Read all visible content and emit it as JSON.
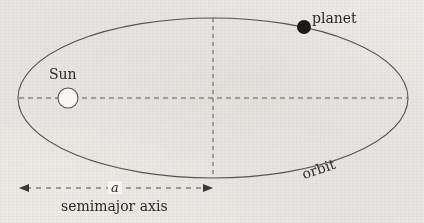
{
  "figure": {
    "width": 424,
    "height": 223,
    "background_color": "#f6f5f3",
    "ink_color": "#4a4845"
  },
  "labels": {
    "planet": "planet",
    "sun": "Sun",
    "orbit": "orbit",
    "semimajor_axis": "semimajor axis",
    "a_symbol": "a"
  },
  "geometry": {
    "ellipse": {
      "center_x": 213,
      "center_y": 98,
      "radius_x": 195,
      "radius_y": 80,
      "stroke": "#55534f",
      "stroke_width": 1.1
    },
    "sun": {
      "center_x": 68,
      "center_y": 98,
      "radius": 10,
      "fill": "#f8f7f5",
      "stroke": "#55534f"
    },
    "planet": {
      "center_x": 304,
      "center_y": 27,
      "radius": 7,
      "fill": "#1c1b1a"
    },
    "major_axis_line": {
      "x1": 19,
      "y1": 98,
      "x2": 408,
      "y2": 98,
      "dash": "5 4"
    },
    "minor_axis_line": {
      "x1": 213,
      "y1": 18,
      "x2": 213,
      "y2": 178,
      "dash": "4 4"
    },
    "semimajor_arrow": {
      "x1": 19,
      "y1": 188,
      "x2": 213,
      "y2": 188,
      "dash": "5 5",
      "double_headed": true
    }
  },
  "chart_data": {
    "type": "diagram",
    "elements": [
      {
        "name": "orbit",
        "shape": "ellipse",
        "label": "orbit"
      },
      {
        "name": "sun",
        "shape": "open-circle",
        "label": "Sun",
        "position": "left focus"
      },
      {
        "name": "planet",
        "shape": "filled-circle",
        "label": "planet",
        "position": "upper right of ellipse"
      },
      {
        "name": "semimajor axis",
        "shape": "double-arrow",
        "label": "a",
        "caption": "semimajor axis",
        "span": "from left vertex to ellipse center"
      }
    ]
  }
}
